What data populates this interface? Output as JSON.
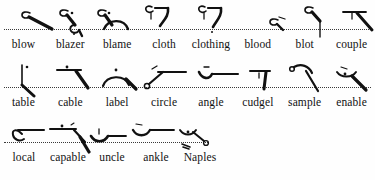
{
  "page": {
    "kind": "shorthand-outline-chart",
    "background_color": "#fefefe",
    "ink_color": "#111111",
    "baseline_style": "dotted"
  },
  "rows": [
    {
      "id": "row-1",
      "words": [
        "blow",
        "blazer",
        "blame",
        "cloth",
        "clothing",
        "blood",
        "blot",
        "couple"
      ]
    },
    {
      "id": "row-2",
      "words": [
        "table",
        "cable",
        "label",
        "circle",
        "angle",
        "cudgel",
        "sample",
        "enable"
      ]
    },
    {
      "id": "row-3",
      "words": [
        "local",
        "capable",
        "uncle",
        "ankle",
        "Naples"
      ]
    }
  ]
}
